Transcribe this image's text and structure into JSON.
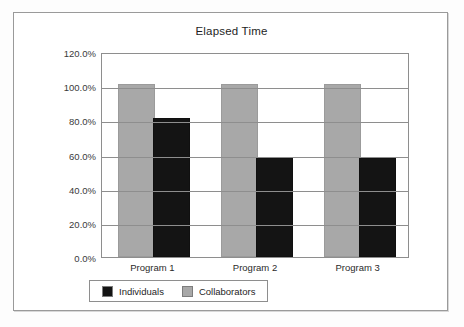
{
  "chart_data": {
    "type": "bar",
    "title": "Elapsed Time",
    "xlabel": "",
    "ylabel": "",
    "categories": [
      "Program 1",
      "Program 2",
      "Program 3"
    ],
    "series": [
      {
        "name": "Individuals",
        "color": "#141414",
        "values": [
          80.0,
          56.5,
          56.5
        ]
      },
      {
        "name": "Collaborators",
        "color": "#a8a8a8",
        "values": [
          100.0,
          100.0,
          100.0
        ]
      }
    ],
    "ylim": [
      0,
      120
    ],
    "ytick_values": [
      120,
      100,
      80,
      60,
      40,
      20,
      0
    ],
    "ytick_labels": [
      "120.0%",
      "100.0%",
      "80.0%",
      "60.0%",
      "40.0%",
      "20.0%",
      "0.0%"
    ],
    "grid": true,
    "legend_position": "bottom"
  },
  "legend": {
    "items": [
      {
        "label": "Individuals",
        "swatch": "black-swatch-icon"
      },
      {
        "label": "Collaborators",
        "swatch": "gray-swatch-icon"
      }
    ]
  }
}
